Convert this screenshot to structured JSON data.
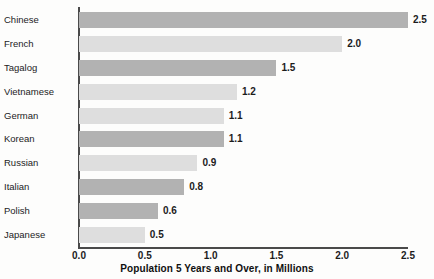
{
  "chart_data": {
    "type": "bar",
    "orientation": "horizontal",
    "title": "",
    "xlabel": "Population 5 Years and Over, in Millions",
    "ylabel": "",
    "categories": [
      "Chinese",
      "French",
      "Tagalog",
      "Vietnamese",
      "German",
      "Korean",
      "Russian",
      "Italian",
      "Polish",
      "Japanese"
    ],
    "values": [
      2.5,
      2.0,
      1.5,
      1.2,
      1.1,
      1.1,
      0.9,
      0.8,
      0.6,
      0.5
    ],
    "value_labels": [
      "2.5",
      "2.0",
      "1.5",
      "1.2",
      "1.1",
      "1.1",
      "0.9",
      "0.8",
      "0.6",
      "0.5"
    ],
    "xlim": [
      0.0,
      2.5
    ],
    "xticks": [
      0.0,
      0.5,
      1.0,
      1.5,
      2.0,
      2.5
    ],
    "xtick_labels": [
      "0.0",
      "0.5",
      "1.0",
      "1.5",
      "2.0",
      "2.5"
    ],
    "grid": false,
    "legend": false,
    "bar_colors": [
      "#b2b2b2",
      "#dedede",
      "#b2b2b2",
      "#dedede",
      "#dedede",
      "#b2b2b2",
      "#dedede",
      "#b2b2b2",
      "#b2b2b2",
      "#dedede"
    ],
    "colors": {
      "bar_dark": "#b2b2b2",
      "bar_light": "#dedede",
      "axis": "#4a4a4a",
      "text": "#1c1c1c",
      "background": "#fdfdfc"
    }
  }
}
